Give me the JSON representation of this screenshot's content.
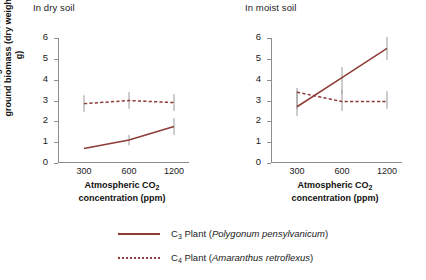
{
  "chart_data": {
    "type": "line",
    "title": "",
    "xlabel": "Atmospheric CO2 concentration (ppm)",
    "ylabel": "Average total above-ground biomass (dry weight, g)",
    "x": [
      300,
      600,
      1200
    ],
    "xtick_labels": [
      "300",
      "600",
      "1200"
    ],
    "ytick_labels": [
      "0",
      "1",
      "2",
      "3",
      "4",
      "5",
      "6"
    ],
    "ylim": [
      0,
      6
    ],
    "grid": false,
    "legend_position": "bottom",
    "panels": [
      {
        "title": "In dry soil",
        "series": [
          {
            "name": "C3 Plant (Polygonum pensylvanicum)",
            "style": "solid",
            "color": "#8e3b36",
            "values": [
              0.7,
              1.1,
              1.75
            ],
            "err_low": [
              0.7,
              0.85,
              1.35
            ],
            "err_high": [
              0.7,
              1.35,
              2.15
            ]
          },
          {
            "name": "C4 Plant (Amaranthus retroflexus)",
            "style": "dashed",
            "color": "#8e3b36",
            "values": [
              2.85,
              3.0,
              2.9
            ],
            "err_low": [
              2.45,
              2.6,
              2.5
            ],
            "err_high": [
              3.25,
              3.4,
              3.3
            ]
          }
        ]
      },
      {
        "title": "In moist soil",
        "series": [
          {
            "name": "C3 Plant (Polygonum pensylvanicum)",
            "style": "solid",
            "color": "#8e3b36",
            "values": [
              2.7,
              4.1,
              5.5
            ],
            "err_low": [
              2.25,
              3.3,
              4.95
            ],
            "err_high": [
              3.45,
              4.6,
              6.05
            ]
          },
          {
            "name": "C4 Plant (Amaranthus retroflexus)",
            "style": "dashed",
            "color": "#8e3b36",
            "values": [
              3.4,
              2.95,
              2.95
            ],
            "err_low": [
              2.6,
              2.5,
              2.6
            ],
            "err_high": [
              3.6,
              3.5,
              3.45
            ]
          }
        ]
      }
    ]
  },
  "axis": {
    "ylabel_line1": "Average total above-",
    "ylabel_line2": "ground biomass (dry weight, g)",
    "xlabel_line1": "Atmospheric CO",
    "xlabel_sub": "2",
    "xlabel_line2": "concentration (ppm)"
  },
  "panel_titles": {
    "left": "In dry soil",
    "right": "In moist soil"
  },
  "ticks": {
    "y": [
      "6",
      "5",
      "4",
      "3",
      "2",
      "1",
      "0"
    ],
    "x": [
      "300",
      "600",
      "1200"
    ]
  },
  "legend": {
    "items": [
      {
        "prefix": "C",
        "sub": "3",
        "label": " Plant (",
        "species": "Polygonum pensylvanicum",
        "suffix": ")",
        "style": "solid",
        "color": "#8e3b36"
      },
      {
        "prefix": "C",
        "sub": "4",
        "label": " Plant (",
        "species": "Amaranthus retroflexus",
        "suffix": ")",
        "style": "dashed",
        "color": "#8e3b36"
      }
    ]
  }
}
